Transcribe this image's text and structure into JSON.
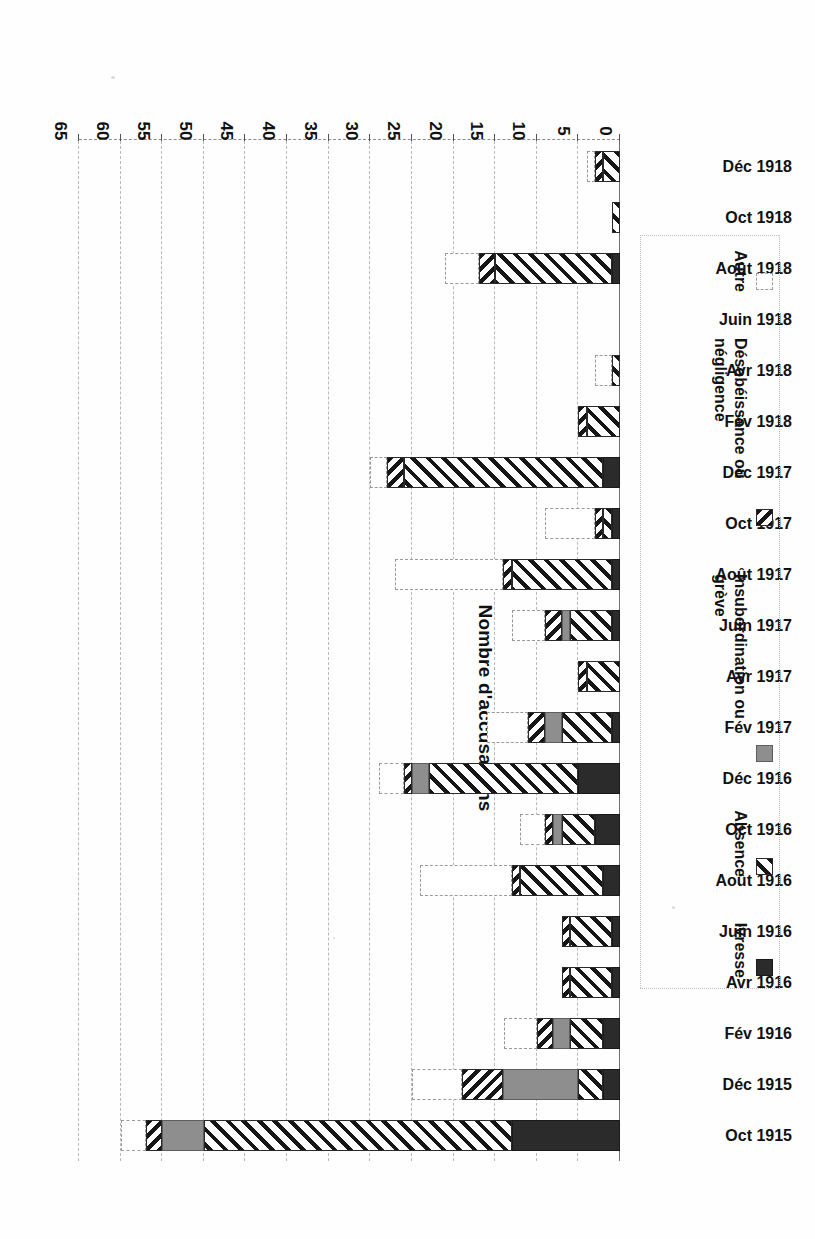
{
  "figure": {
    "axis_title": "Nombre d'accusations",
    "orientation": "rotated-180"
  },
  "legend": {
    "items": [
      {
        "label": "Ivresse",
        "key": "ivresse",
        "color": "#2b2b2b"
      },
      {
        "label": "Absence",
        "key": "absence",
        "color": "#161616"
      },
      {
        "label": "Insubordination ou grève",
        "key": "insubordination",
        "color": "#8e8e8e"
      },
      {
        "label": "Désobéissance ou négligence",
        "key": "desobeissance",
        "color": "#161616"
      },
      {
        "label": "Autre",
        "key": "autre",
        "color": "#ffffff"
      }
    ]
  },
  "axis": {
    "ticks": [
      "0",
      "5",
      "10",
      "15",
      "20",
      "25",
      "30",
      "35",
      "40",
      "45",
      "50",
      "55",
      "60",
      "65"
    ],
    "min": 0,
    "max": 65
  },
  "chart_data": {
    "type": "bar",
    "subtype": "stacked-horizontal",
    "title": "",
    "xlabel": "Nombre d'accusations",
    "ylabel": "",
    "xlim": [
      0,
      65
    ],
    "grid": true,
    "legend_position": "inside-left",
    "categories": [
      "Oct 1915",
      "Déc 1915",
      "Fév 1916",
      "Avr 1916",
      "Juin 1916",
      "Août 1916",
      "Oct 1916",
      "Déc 1916",
      "Fév 1917",
      "Avr 1917",
      "Juin 1917",
      "Août 1917",
      "Oct 1917",
      "Déc 1917",
      "Fév 1918",
      "Avr 1918",
      "Juin 1918",
      "Août 1918",
      "Oct 1918",
      "Déc 1918"
    ],
    "series": [
      {
        "name": "Ivresse",
        "values": [
          13,
          2,
          2,
          1,
          1,
          2,
          3,
          5,
          1,
          0,
          1,
          1,
          1,
          2,
          0,
          0,
          0,
          1,
          0,
          0
        ]
      },
      {
        "name": "Absence",
        "values": [
          37,
          3,
          4,
          5,
          5,
          10,
          4,
          18,
          6,
          4,
          5,
          12,
          1,
          24,
          4,
          1,
          0,
          14,
          1,
          2
        ]
      },
      {
        "name": "Insubordination ou grève",
        "values": [
          5,
          9,
          2,
          0,
          0,
          0,
          1,
          2,
          2,
          0,
          1,
          0,
          0,
          0,
          0,
          0,
          0,
          0,
          0,
          0
        ]
      },
      {
        "name": "Désobéissance ou négligence",
        "values": [
          2,
          5,
          2,
          1,
          1,
          1,
          1,
          1,
          2,
          1,
          2,
          1,
          1,
          2,
          1,
          0,
          0,
          2,
          0,
          1
        ]
      },
      {
        "name": "Autre",
        "values": [
          3,
          6,
          4,
          0,
          0,
          11,
          3,
          3,
          5,
          0,
          4,
          13,
          6,
          2,
          0,
          2,
          0,
          4,
          0,
          1
        ]
      }
    ]
  }
}
